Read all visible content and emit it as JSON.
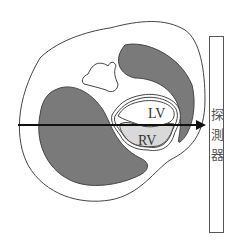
{
  "diagram": {
    "labels": {
      "lv": "LV",
      "rv": "RV"
    },
    "detector": {
      "chars": [
        "探",
        "測",
        "器"
      ]
    },
    "colors": {
      "outline": "#444444",
      "lung_fill": "#7a7a7a",
      "rv_fill": "#d9d9d9",
      "background": "#ffffff",
      "arrow": "#111111"
    }
  }
}
